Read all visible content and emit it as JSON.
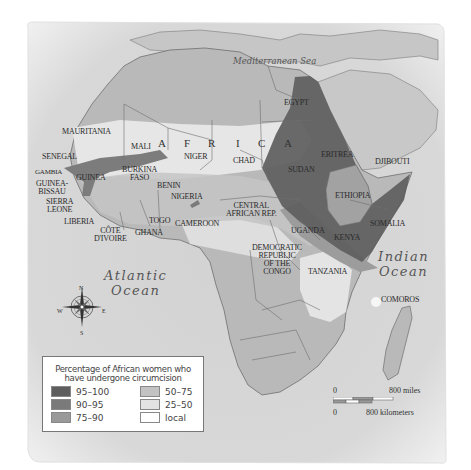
{
  "map": {
    "title": "AFRICA",
    "title_letters": [
      "A",
      "F",
      "R",
      "I",
      "C",
      "A"
    ],
    "seas": {
      "mediterranean": "Mediterranean Sea",
      "atlantic": [
        "Atlantic",
        "Ocean"
      ],
      "indian": [
        "Indian",
        "Ocean"
      ]
    },
    "countries": {
      "mauritania": "MAURITANIA",
      "senegal": "SENEGAL",
      "gambia": "GAMBIA",
      "guinea_bissau": [
        "GUINEA-",
        "BISSAU"
      ],
      "guinea": "GUINEA",
      "sierra_leone": [
        "SIERRA",
        "LEONE"
      ],
      "liberia": "LIBERIA",
      "cote_divoire": [
        "CÔTE",
        "D'IVOIRE"
      ],
      "mali": "MALI",
      "burkina_faso": [
        "BURKINA",
        "FASO"
      ],
      "ghana": "GHANA",
      "togo": "TOGO",
      "benin": "BENIN",
      "niger": "NIGER",
      "nigeria": "NIGERIA",
      "cameroon": "CAMEROON",
      "chad": "CHAD",
      "central_african_rep": [
        "CENTRAL",
        "AFRICAN REP."
      ],
      "egypt": "EGYPT",
      "sudan": "SUDAN",
      "eritrea": "ERITREA",
      "djibouti": "DJIBOUTI",
      "ethiopia": "ETHIOPIA",
      "somalia": "SOMALIA",
      "uganda": "UGANDA",
      "kenya": "KENYA",
      "tanzania": "TANZANIA",
      "drc": [
        "DEMOCRATIC",
        "REPUBLIC",
        "OF THE",
        "CONGO"
      ],
      "comoros": "COMOROS"
    },
    "compass": {
      "n": "N",
      "s": "S",
      "e": "E",
      "w": "W"
    }
  },
  "legend": {
    "title": [
      "Percentage of African women who",
      "have undergone circumcision"
    ],
    "items": [
      {
        "label": "95–100",
        "color": "#5e5e5e"
      },
      {
        "label": "90–95",
        "color": "#7a7a7a"
      },
      {
        "label": "75–90",
        "color": "#999999"
      },
      {
        "label": "50–75",
        "color": "#c2c2c2"
      },
      {
        "label": "25–50",
        "color": "#e3e3e3"
      },
      {
        "label": "local",
        "color": "#ffffff"
      }
    ]
  },
  "scale": {
    "miles_zero": "0",
    "miles_label": "800 miles",
    "km_zero": "0",
    "km_label": "800 kilometers"
  },
  "colors": {
    "sea": "#d4d4d4",
    "land": "#b9b9b9",
    "border": "#6f6f6f",
    "frame_edge": "#f2f2f2"
  }
}
